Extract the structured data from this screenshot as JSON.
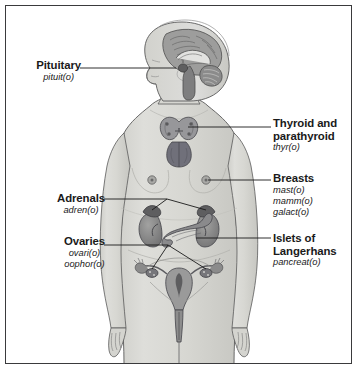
{
  "figure": {
    "colors": {
      "frame": "#3a3a3c",
      "background": "#ffffff",
      "skin": "#d9d9d6",
      "skin_shadow": "#c2c2bd",
      "organ_dark": "#6e6e70",
      "organ_mid": "#8f8f8f",
      "organ_light": "#b5b5b3",
      "outline": "#4a4a4a",
      "leader_line": "#1a1a1a",
      "text": "#1a1a1a"
    }
  },
  "labels": {
    "pituitary": {
      "title": "Pituitary",
      "combining_forms": [
        "pituit(o)"
      ]
    },
    "adrenals": {
      "title": "Adrenals",
      "combining_forms": [
        "adren(o)"
      ]
    },
    "ovaries": {
      "title": "Ovaries",
      "combining_forms": [
        "ovari(o)",
        "oophor(o)"
      ]
    },
    "thyroid": {
      "title_line1": "Thyroid and",
      "title_line2": "parathyroid",
      "combining_forms": [
        "thyr(o)"
      ]
    },
    "breasts": {
      "title": "Breasts",
      "combining_forms": [
        "mast(o)",
        "mamm(o)",
        "galact(o)"
      ]
    },
    "islets": {
      "title_line1": "Islets of",
      "title_line2": "Langerhans",
      "combining_forms": [
        "pancreat(o)"
      ]
    }
  },
  "organs": [
    {
      "name": "brain-sagittal-section",
      "location": "head"
    },
    {
      "name": "pituitary-gland",
      "location": "base of brain"
    },
    {
      "name": "thyroid-gland",
      "location": "neck"
    },
    {
      "name": "parathyroid-glands",
      "location": "behind thyroid"
    },
    {
      "name": "breast-nipple-left",
      "location": "chest"
    },
    {
      "name": "breast-nipple-right",
      "location": "chest"
    },
    {
      "name": "adrenal-gland-left",
      "location": "atop kidney"
    },
    {
      "name": "adrenal-gland-right",
      "location": "atop kidney"
    },
    {
      "name": "kidney-left",
      "location": "abdomen"
    },
    {
      "name": "kidney-right",
      "location": "abdomen"
    },
    {
      "name": "pancreas-islets-of-langerhans",
      "location": "abdomen"
    },
    {
      "name": "ovary-left",
      "location": "pelvis"
    },
    {
      "name": "ovary-right",
      "location": "pelvis"
    },
    {
      "name": "uterus",
      "location": "pelvis"
    },
    {
      "name": "fallopian-tubes",
      "location": "pelvis"
    },
    {
      "name": "vagina",
      "location": "pelvis"
    }
  ]
}
